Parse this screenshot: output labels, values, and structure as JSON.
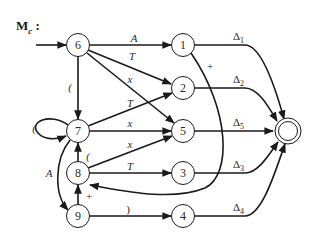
{
  "title": {
    "main": "M",
    "sub": "c",
    "suffix": ":"
  },
  "nodes": [
    {
      "id": "6",
      "x": 78,
      "y": 45
    },
    {
      "id": "1",
      "x": 183,
      "y": 45
    },
    {
      "id": "2",
      "x": 183,
      "y": 88
    },
    {
      "id": "7",
      "x": 78,
      "y": 131
    },
    {
      "id": "5",
      "x": 183,
      "y": 131
    },
    {
      "id": "8",
      "x": 78,
      "y": 173
    },
    {
      "id": "3",
      "x": 183,
      "y": 173
    },
    {
      "id": "9",
      "x": 78,
      "y": 216
    },
    {
      "id": "4",
      "x": 183,
      "y": 216
    }
  ],
  "final_state": {
    "x": 288,
    "y": 131
  },
  "edges": [
    {
      "from": "start",
      "to": "6",
      "label": ""
    },
    {
      "from": "6",
      "to": "1",
      "label": "A"
    },
    {
      "from": "6",
      "to": "2",
      "label": "T"
    },
    {
      "from": "6",
      "to": "5",
      "label": "x"
    },
    {
      "from": "6",
      "to": "7",
      "label": "("
    },
    {
      "from": "7",
      "to": "7",
      "label": "("
    },
    {
      "from": "7",
      "to": "2",
      "label": "T"
    },
    {
      "from": "7",
      "to": "5",
      "label": "x"
    },
    {
      "from": "7",
      "to": "9",
      "label": "A"
    },
    {
      "from": "8",
      "to": "7",
      "label": "("
    },
    {
      "from": "8",
      "to": "5",
      "label": "x"
    },
    {
      "from": "8",
      "to": "3",
      "label": "T"
    },
    {
      "from": "9",
      "to": "8",
      "label": "+"
    },
    {
      "from": "9",
      "to": "4",
      "label": ")"
    },
    {
      "from": "1",
      "to": "8",
      "label": "+"
    },
    {
      "from": "1",
      "to": "final",
      "label": "Δ1"
    },
    {
      "from": "2",
      "to": "final",
      "label": "Δ2"
    },
    {
      "from": "5",
      "to": "final",
      "label": "Δ5"
    },
    {
      "from": "3",
      "to": "final",
      "label": "Δ3"
    },
    {
      "from": "4",
      "to": "final",
      "label": "Δ4"
    }
  ],
  "labels": {
    "n6": "6",
    "n1": "1",
    "n2": "2",
    "n7": "7",
    "n5": "5",
    "n8": "8",
    "n3": "3",
    "n9": "9",
    "n4": "4",
    "e6_1": "A",
    "e6_2": "T",
    "e6_5": "x",
    "e6_7": "(",
    "e7_7": "(",
    "e7_2": "T",
    "e7_5": "x",
    "e7_9": "A",
    "e8_7": "(",
    "e8_5": "x",
    "e8_3": "T",
    "e9_8": "+",
    "e9_4": ")",
    "e1_8": "+",
    "d1": "Δ",
    "d1s": "1",
    "d2": "Δ",
    "d2s": "2",
    "d5": "Δ",
    "d5s": "5",
    "d3": "Δ",
    "d3s": "3",
    "d4": "Δ",
    "d4s": "4"
  },
  "colors": {
    "stroke": "#1a1a1a",
    "fill": "#ffffff"
  }
}
